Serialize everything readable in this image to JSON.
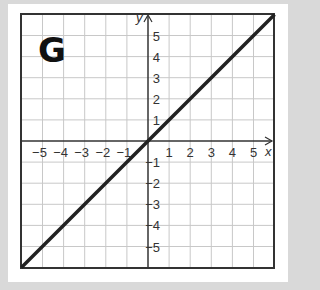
{
  "panel_label": "G",
  "chart_data": {
    "type": "line",
    "title": "",
    "xlabel": "x",
    "ylabel": "y",
    "xlim": [
      -6,
      6
    ],
    "ylim": [
      -6,
      6
    ],
    "grid": true,
    "x_ticks": [
      "-5",
      "-4",
      "-3",
      "-2",
      "-1",
      "1",
      "2",
      "3",
      "4",
      "5"
    ],
    "y_ticks": [
      "5",
      "4",
      "3",
      "2",
      "1",
      "-1",
      "-2",
      "-3",
      "-4",
      "-5"
    ],
    "series": [
      {
        "name": "y = x",
        "x": [
          -6,
          6
        ],
        "y": [
          -6,
          6
        ],
        "color": "#222222"
      }
    ]
  }
}
